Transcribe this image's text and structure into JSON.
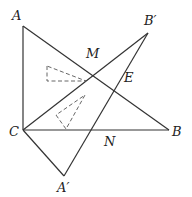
{
  "diagram": {
    "type": "geometry-figure",
    "stroke_color": "#333333",
    "points": {
      "A": {
        "label": "A",
        "x": 23,
        "y": 26,
        "lx": 12,
        "ly": 20
      },
      "B": {
        "label": "B",
        "x": 169,
        "y": 130,
        "lx": 172,
        "ly": 136
      },
      "C": {
        "label": "C",
        "x": 23,
        "y": 130,
        "lx": 9,
        "ly": 136
      },
      "Bp": {
        "label": "B′",
        "x": 148,
        "y": 33,
        "lx": 144,
        "ly": 25
      },
      "Ap": {
        "label": "A′",
        "x": 64,
        "y": 176,
        "lx": 57,
        "ly": 192
      },
      "M": {
        "label": "M",
        "x": 88,
        "y": 64,
        "lx": 86,
        "ly": 58
      },
      "E": {
        "label": "E",
        "x": 121,
        "y": 82,
        "lx": 124,
        "ly": 82
      },
      "N": {
        "label": "N",
        "x": 106,
        "y": 130,
        "lx": 104,
        "ly": 146
      }
    },
    "segments": [
      [
        "A",
        "C"
      ],
      [
        "A",
        "B"
      ],
      [
        "C",
        "B"
      ],
      [
        "C",
        "Bp"
      ],
      [
        "Bp",
        "Ap"
      ],
      [
        "C",
        "Ap"
      ]
    ],
    "dashed_triangles": [
      [
        [
          47,
          66
        ],
        [
          47,
          81
        ],
        [
          86,
          81
        ]
      ],
      [
        [
          56,
          115
        ],
        [
          66,
          129
        ],
        [
          85,
          95
        ]
      ]
    ]
  }
}
